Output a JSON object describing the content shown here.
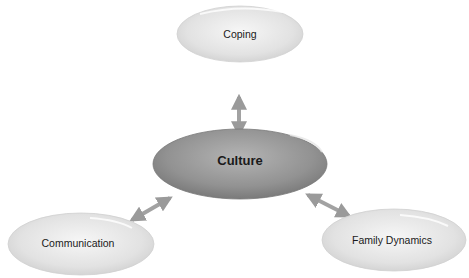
{
  "diagram": {
    "center": {
      "label": "Culture"
    },
    "nodes": [
      {
        "id": "coping",
        "label": "Coping"
      },
      {
        "id": "communication",
        "label": "Communication"
      },
      {
        "id": "family",
        "label": "Family Dynamics"
      }
    ],
    "edges": [
      {
        "from": "Culture",
        "to": "Coping",
        "type": "bidirectional"
      },
      {
        "from": "Culture",
        "to": "Communication",
        "type": "bidirectional"
      },
      {
        "from": "Culture",
        "to": "Family Dynamics",
        "type": "bidirectional"
      }
    ],
    "colors": {
      "center": "#8f8f8f",
      "outer": "#dedede",
      "arrow": "#9a9a9a"
    }
  }
}
